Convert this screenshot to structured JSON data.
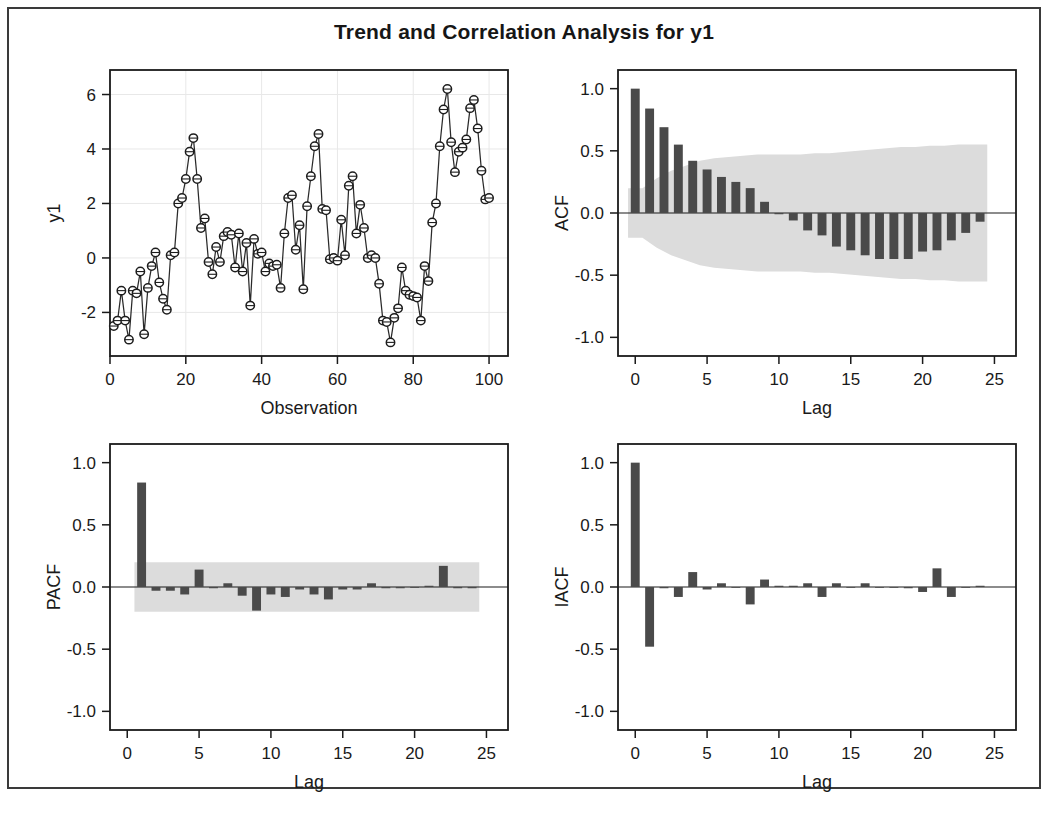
{
  "figure": {
    "title": "Trend and Correlation Analysis for y1",
    "border_color": "#3a3a3a",
    "background": "#ffffff",
    "bar_color": "#4a4a4a",
    "band_color": "#dcdcdc",
    "line_color": "#2a2a2a"
  },
  "chart_data": [
    {
      "type": "line",
      "panel": "top-left",
      "title": "",
      "xlabel": "Observation",
      "ylabel": "y1",
      "xlim": [
        0,
        105
      ],
      "ylim": [
        -3.6,
        6.9
      ],
      "xticks": [
        0,
        20,
        40,
        60,
        80,
        100
      ],
      "yticks": [
        -2,
        0,
        2,
        4,
        6
      ],
      "grid": true,
      "markers": "open-circle",
      "x": [
        1,
        2,
        3,
        4,
        5,
        6,
        7,
        8,
        9,
        10,
        11,
        12,
        13,
        14,
        15,
        16,
        17,
        18,
        19,
        20,
        21,
        22,
        23,
        24,
        25,
        26,
        27,
        28,
        29,
        30,
        31,
        32,
        33,
        34,
        35,
        36,
        37,
        38,
        39,
        40,
        41,
        42,
        43,
        44,
        45,
        46,
        47,
        48,
        49,
        50,
        51,
        52,
        53,
        54,
        55,
        56,
        57,
        58,
        59,
        60,
        61,
        62,
        63,
        64,
        65,
        66,
        67,
        68,
        69,
        70,
        71,
        72,
        73,
        74,
        75,
        76,
        77,
        78,
        79,
        80,
        81,
        82,
        83,
        84,
        85,
        86,
        87,
        88,
        89,
        90,
        91,
        92,
        93,
        94,
        95,
        96,
        97,
        98,
        99,
        100
      ],
      "values": [
        -2.5,
        -2.3,
        -1.2,
        -2.3,
        -3.0,
        -1.2,
        -1.3,
        -0.5,
        -2.8,
        -1.1,
        -0.3,
        0.2,
        -0.9,
        -1.5,
        -1.9,
        0.1,
        0.2,
        2.0,
        2.2,
        2.9,
        3.9,
        4.4,
        2.9,
        1.1,
        1.45,
        -0.15,
        -0.6,
        0.4,
        -0.15,
        0.8,
        0.95,
        0.85,
        -0.35,
        0.9,
        -0.5,
        0.55,
        -1.75,
        0.7,
        0.15,
        0.2,
        -0.5,
        -0.2,
        -0.3,
        -0.25,
        -1.1,
        0.9,
        2.2,
        2.3,
        0.3,
        1.2,
        -1.15,
        1.9,
        3.0,
        4.1,
        4.55,
        1.8,
        1.75,
        -0.05,
        0.0,
        -0.1,
        1.4,
        0.1,
        2.65,
        3.0,
        0.9,
        1.95,
        1.1,
        0.0,
        0.1,
        0.0,
        -0.95,
        -2.3,
        -2.35,
        -3.1,
        -2.2,
        -1.85,
        -0.35,
        -1.2,
        -1.35,
        -1.4,
        -1.45,
        -2.3,
        -0.3,
        -0.85,
        1.3,
        2.0,
        4.1,
        5.45,
        6.2,
        4.25,
        3.15,
        3.9,
        4.05,
        4.35,
        5.5,
        5.8,
        4.75,
        3.2,
        2.15,
        2.2
      ]
    },
    {
      "type": "bar",
      "panel": "top-right",
      "title": "",
      "xlabel": "Lag",
      "ylabel": "ACF",
      "xlim": [
        -1.2,
        26.5
      ],
      "ylim": [
        -1.15,
        1.15
      ],
      "xticks": [
        0,
        5,
        10,
        15,
        20,
        25
      ],
      "yticks": [
        -1.0,
        -0.5,
        0.0,
        0.5,
        1.0
      ],
      "yticklabels": [
        "-1.0",
        "-0.5",
        "0.0",
        "0.5",
        "1.0"
      ],
      "grid": false,
      "lags": [
        0,
        1,
        2,
        3,
        4,
        5,
        6,
        7,
        8,
        9,
        10,
        11,
        12,
        13,
        14,
        15,
        16,
        17,
        18,
        19,
        20,
        21,
        22,
        23,
        24
      ],
      "values": [
        1.0,
        0.84,
        0.69,
        0.55,
        0.42,
        0.35,
        0.29,
        0.25,
        0.2,
        0.09,
        -0.01,
        -0.06,
        -0.14,
        -0.18,
        -0.27,
        -0.3,
        -0.34,
        -0.37,
        -0.37,
        -0.37,
        -0.31,
        -0.3,
        -0.22,
        -0.16,
        -0.07
      ],
      "band_upper": [
        0.2,
        0.2,
        0.28,
        0.34,
        0.38,
        0.42,
        0.44,
        0.45,
        0.46,
        0.47,
        0.47,
        0.47,
        0.47,
        0.48,
        0.48,
        0.49,
        0.5,
        0.51,
        0.52,
        0.53,
        0.53,
        0.54,
        0.54,
        0.55,
        0.55
      ],
      "band_lower": [
        -0.2,
        -0.2,
        -0.28,
        -0.34,
        -0.38,
        -0.42,
        -0.44,
        -0.45,
        -0.46,
        -0.47,
        -0.47,
        -0.47,
        -0.47,
        -0.48,
        -0.48,
        -0.49,
        -0.5,
        -0.51,
        -0.52,
        -0.53,
        -0.53,
        -0.54,
        -0.54,
        -0.55,
        -0.55
      ],
      "band_type": "tapered"
    },
    {
      "type": "bar",
      "panel": "bottom-left",
      "title": "",
      "xlabel": "Lag",
      "ylabel": "PACF",
      "xlim": [
        -1.2,
        26.5
      ],
      "ylim": [
        -1.15,
        1.15
      ],
      "xticks": [
        0,
        5,
        10,
        15,
        20,
        25
      ],
      "yticks": [
        -1.0,
        -0.5,
        0.0,
        0.5,
        1.0
      ],
      "yticklabels": [
        "-1.0",
        "-0.5",
        "0.0",
        "0.5",
        "1.0"
      ],
      "grid": false,
      "lags": [
        1,
        2,
        3,
        4,
        5,
        6,
        7,
        8,
        9,
        10,
        11,
        12,
        13,
        14,
        15,
        16,
        17,
        18,
        19,
        20,
        21,
        22,
        23,
        24
      ],
      "values": [
        0.84,
        -0.03,
        -0.03,
        -0.06,
        0.14,
        -0.01,
        0.03,
        -0.07,
        -0.19,
        -0.06,
        -0.08,
        -0.02,
        -0.06,
        -0.1,
        -0.02,
        -0.02,
        0.03,
        -0.01,
        -0.01,
        0.0,
        0.01,
        0.17,
        -0.01,
        -0.01
      ],
      "band_upper": [
        0.2,
        0.2,
        0.2,
        0.2,
        0.2,
        0.2,
        0.2,
        0.2,
        0.2,
        0.2,
        0.2,
        0.2,
        0.2,
        0.2,
        0.2,
        0.2,
        0.2,
        0.2,
        0.2,
        0.2,
        0.2,
        0.2,
        0.2,
        0.2
      ],
      "band_lower": [
        -0.2,
        -0.2,
        -0.2,
        -0.2,
        -0.2,
        -0.2,
        -0.2,
        -0.2,
        -0.2,
        -0.2,
        -0.2,
        -0.2,
        -0.2,
        -0.2,
        -0.2,
        -0.2,
        -0.2,
        -0.2,
        -0.2,
        -0.2,
        -0.2,
        -0.2,
        -0.2,
        -0.2
      ],
      "band_type": "flat"
    },
    {
      "type": "bar",
      "panel": "bottom-right",
      "title": "",
      "xlabel": "Lag",
      "ylabel": "IACF",
      "xlim": [
        -1.2,
        26.5
      ],
      "ylim": [
        -1.15,
        1.15
      ],
      "xticks": [
        0,
        5,
        10,
        15,
        20,
        25
      ],
      "yticks": [
        -1.0,
        -0.5,
        0.0,
        0.5,
        1.0
      ],
      "yticklabels": [
        "-1.0",
        "-0.5",
        "0.0",
        "0.5",
        "1.0"
      ],
      "grid": false,
      "lags": [
        0,
        1,
        2,
        3,
        4,
        5,
        6,
        7,
        8,
        9,
        10,
        11,
        12,
        13,
        14,
        15,
        16,
        17,
        18,
        19,
        20,
        21,
        22,
        23,
        24
      ],
      "values": [
        1.0,
        -0.48,
        -0.01,
        -0.08,
        0.12,
        -0.02,
        0.03,
        0.0,
        -0.14,
        0.06,
        0.01,
        0.01,
        0.03,
        -0.08,
        0.03,
        0.0,
        0.03,
        0.0,
        0.0,
        -0.01,
        -0.04,
        0.15,
        -0.08,
        0.0,
        0.01
      ],
      "band_upper": [
        0.2,
        0.2,
        0.2,
        0.2,
        0.2,
        0.2,
        0.2,
        0.2,
        0.2,
        0.2,
        0.2,
        0.2,
        0.2,
        0.2,
        0.2,
        0.2,
        0.2,
        0.2,
        0.2,
        0.2,
        0.2,
        0.2,
        0.2,
        0.2,
        0.2
      ],
      "band_lower": [
        -0.2,
        -0.2,
        -0.2,
        -0.2,
        -0.2,
        -0.2,
        -0.2,
        -0.2,
        -0.2,
        -0.2,
        -0.2,
        -0.2,
        -0.2,
        -0.2,
        -0.2,
        -0.2,
        -0.2,
        -0.2,
        -0.2,
        -0.2,
        -0.2,
        -0.2,
        -0.2,
        -0.2
      ],
      "band_type": "flat"
    }
  ]
}
